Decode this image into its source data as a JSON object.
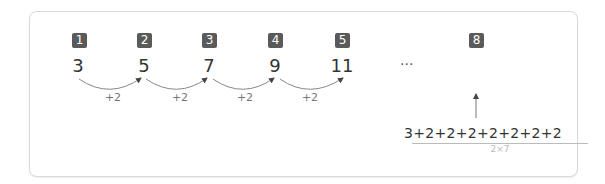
{
  "sequence": {
    "terms": [
      {
        "index": "1",
        "value": "3"
      },
      {
        "index": "2",
        "value": "5"
      },
      {
        "index": "3",
        "value": "7"
      },
      {
        "index": "4",
        "value": "9"
      },
      {
        "index": "5",
        "value": "11"
      }
    ],
    "step_labels": [
      "+2",
      "+2",
      "+2",
      "+2"
    ],
    "ellipsis": "···",
    "target": {
      "index": "8"
    },
    "expansion": "3+2+2+2+2+2+2+2",
    "brace_label": "2×7"
  },
  "colors": {
    "badge_bg": "#5a5a5a",
    "badge_text": "#ffffff",
    "text": "#333333",
    "muted": "#777777",
    "border": "#d9d9d9"
  }
}
